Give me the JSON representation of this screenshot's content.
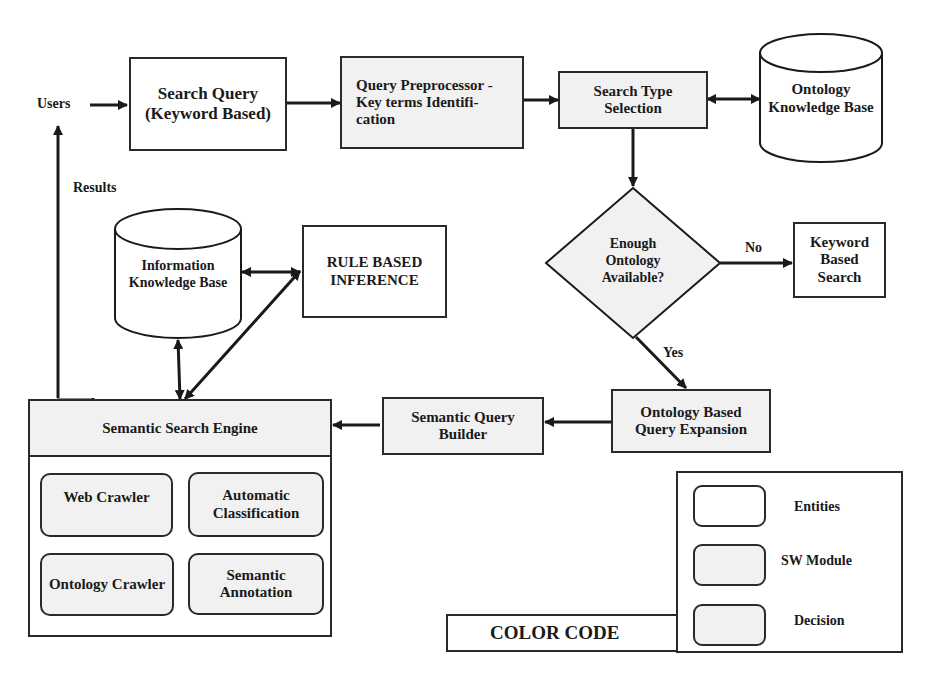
{
  "diagram": {
    "users_label": "Users",
    "results_label": "Results",
    "search_query": "Search Query (Keyword Based)",
    "query_preprocessor": "Query Preprocessor -Key terms Identifi- cation",
    "search_type_selection": "Search Type Selection",
    "ontology_kb": "Ontology Knowledge Base",
    "decision": "Enough Ontology Available?",
    "no_label": "No",
    "yes_label": "Yes",
    "keyword_search": "Keyword Based Search",
    "ontology_expansion": "Ontology Based Query Expansion",
    "semantic_query_builder": "Semantic Query Builder",
    "information_kb": "Information Knowledge Base",
    "rule_inference": "RULE BASED INFERENCE",
    "semantic_engine": {
      "title": "Semantic Search Engine",
      "modules": [
        "Web Crawler",
        "Automatic Classification",
        "Ontology Crawler",
        "Semantic Annotation"
      ]
    },
    "legend": {
      "title": "COLOR CODE",
      "items": [
        "Entities",
        "SW Module",
        "Decision"
      ]
    }
  }
}
